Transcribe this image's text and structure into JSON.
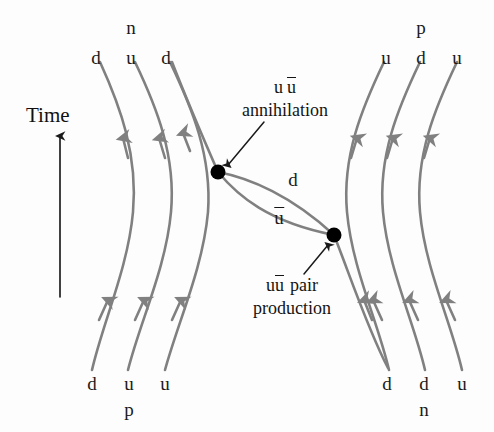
{
  "figure": {
    "type": "feynman-quark-line-diagram",
    "background_color": "#fdfdfd",
    "quark_line_color": "#808080",
    "vertex_color": "#000000",
    "text_color": "#1a1a1a"
  },
  "axis": {
    "label": "Time",
    "direction": "up",
    "arrow_x": 60,
    "arrow_top_y": 133,
    "arrow_bottom_y": 297
  },
  "top_left_hadron": {
    "name": "n",
    "quarks": [
      {
        "label": "d",
        "x": 96
      },
      {
        "label": "u",
        "x": 131
      },
      {
        "label": "d",
        "x": 166
      }
    ]
  },
  "top_right_hadron": {
    "name": "p",
    "quarks": [
      {
        "label": "u",
        "x": 386
      },
      {
        "label": "d",
        "x": 421
      },
      {
        "label": "u",
        "x": 457
      }
    ]
  },
  "bottom_left_hadron": {
    "name": "p",
    "quarks": [
      {
        "label": "d",
        "x": 92
      },
      {
        "label": "u",
        "x": 129
      },
      {
        "label": "u",
        "x": 165
      }
    ]
  },
  "bottom_right_hadron": {
    "name": "n",
    "quarks": [
      {
        "label": "d",
        "x": 387
      },
      {
        "label": "d",
        "x": 424
      },
      {
        "label": "u",
        "x": 462
      }
    ]
  },
  "annotations": {
    "annihilation": {
      "line1_a": "u",
      "line1_b": "u",
      "line1_b_barred": true,
      "line2": "annihilation",
      "x": 285,
      "y": 83
    },
    "pair_production": {
      "line1_a": "u",
      "line1_b": "u",
      "line1_b_barred": true,
      "line1_suffix": "pair",
      "line2": "production",
      "x": 292,
      "y": 281
    }
  },
  "exchange_labels": [
    {
      "label": "d",
      "barred": false,
      "x": 293,
      "y": 179
    },
    {
      "label": "u",
      "barred": true,
      "x": 279,
      "y": 216
    }
  ],
  "vertices": [
    {
      "name": "annihilation-vertex",
      "x": 218,
      "y": 172,
      "r": 7.5
    },
    {
      "name": "pair-production-vertex",
      "x": 334,
      "y": 235,
      "r": 7.5
    }
  ]
}
